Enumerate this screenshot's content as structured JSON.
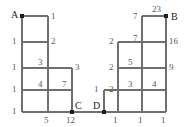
{
  "figure": {
    "type": "grid-diagram",
    "colors": {
      "line": "#6f6f71",
      "vertex": "#1d1d1b",
      "label": "#58585a",
      "point_label": "#1d1d1b",
      "background": "#ffffff"
    }
  },
  "left_figure": {
    "name": "left-grid",
    "vertices": [
      {
        "id": "A",
        "label": "A",
        "x": 22,
        "y": 16
      },
      {
        "id": "C",
        "label": "C",
        "x": 72,
        "y": 112
      }
    ],
    "edges": [
      {
        "id": "l-top",
        "orientation": "horizontal",
        "x1": 22,
        "y1": 16,
        "x2": 48,
        "y2": 16
      },
      {
        "id": "l-r2",
        "orientation": "horizontal",
        "x1": 22,
        "y1": 42,
        "x2": 48,
        "y2": 42
      },
      {
        "id": "l-r3",
        "orientation": "horizontal",
        "x1": 22,
        "y1": 68,
        "x2": 72,
        "y2": 68
      },
      {
        "id": "l-r4",
        "orientation": "horizontal",
        "x1": 22,
        "y1": 90,
        "x2": 72,
        "y2": 90
      },
      {
        "id": "l-base",
        "orientation": "horizontal",
        "x1": 22,
        "y1": 112,
        "x2": 72,
        "y2": 112
      },
      {
        "id": "l-c1",
        "orientation": "vertical",
        "x1": 22,
        "y1": 16,
        "x2": 22,
        "y2": 112
      },
      {
        "id": "l-c2",
        "orientation": "vertical",
        "x1": 48,
        "y1": 16,
        "x2": 48,
        "y2": 112
      },
      {
        "id": "l-c3",
        "orientation": "vertical",
        "x1": 72,
        "y1": 68,
        "x2": 72,
        "y2": 112
      }
    ],
    "labels": [
      {
        "id": "left-A",
        "text": "A",
        "x": 11,
        "y": 10,
        "kind": "point"
      },
      {
        "id": "left-C",
        "text": "C",
        "x": 75,
        "y": 101,
        "kind": "point"
      },
      {
        "id": "left-top-1",
        "text": "1",
        "x": 51,
        "y": 12,
        "kind": "weight"
      },
      {
        "id": "left-row2-left-1",
        "text": "1",
        "x": 12,
        "y": 37,
        "kind": "weight"
      },
      {
        "id": "left-row2-right-2",
        "text": "2",
        "x": 51,
        "y": 37,
        "kind": "weight"
      },
      {
        "id": "left-row3-left-1",
        "text": "1",
        "x": 12,
        "y": 63,
        "kind": "weight"
      },
      {
        "id": "left-row3-mid-3",
        "text": "3",
        "x": 38,
        "y": 58,
        "kind": "weight"
      },
      {
        "id": "left-row3-right-3",
        "text": "3",
        "x": 75,
        "y": 63,
        "kind": "weight"
      },
      {
        "id": "left-row4-left-1",
        "text": "1",
        "x": 12,
        "y": 85,
        "kind": "weight"
      },
      {
        "id": "left-row4-mid-4",
        "text": "4",
        "x": 38,
        "y": 80,
        "kind": "weight"
      },
      {
        "id": "left-row4-right-7",
        "text": "7",
        "x": 62,
        "y": 80,
        "kind": "weight"
      },
      {
        "id": "left-row5-left-1",
        "text": "1",
        "x": 12,
        "y": 107,
        "kind": "weight"
      },
      {
        "id": "left-bottom-5",
        "text": "5",
        "x": 44,
        "y": 116,
        "kind": "weight"
      },
      {
        "id": "left-bottom-12",
        "text": "12",
        "x": 66,
        "y": 116,
        "kind": "weight"
      }
    ]
  },
  "right_figure": {
    "name": "right-grid",
    "vertices": [
      {
        "id": "D",
        "label": "D",
        "x": 104,
        "y": 112
      },
      {
        "id": "B",
        "label": "B",
        "x": 166,
        "y": 16
      }
    ],
    "edges": [
      {
        "id": "r-top",
        "orientation": "horizontal",
        "x1": 142,
        "y1": 16,
        "x2": 166,
        "y2": 16
      },
      {
        "id": "r-r2",
        "orientation": "horizontal",
        "x1": 118,
        "y1": 42,
        "x2": 166,
        "y2": 42
      },
      {
        "id": "r-r3",
        "orientation": "horizontal",
        "x1": 118,
        "y1": 68,
        "x2": 166,
        "y2": 68
      },
      {
        "id": "r-r4",
        "orientation": "horizontal",
        "x1": 104,
        "y1": 90,
        "x2": 166,
        "y2": 90
      },
      {
        "id": "r-base",
        "orientation": "horizontal",
        "x1": 104,
        "y1": 112,
        "x2": 166,
        "y2": 112
      },
      {
        "id": "r-c1",
        "orientation": "vertical",
        "x1": 104,
        "y1": 90,
        "x2": 104,
        "y2": 112
      },
      {
        "id": "r-c2",
        "orientation": "vertical",
        "x1": 118,
        "y1": 42,
        "x2": 118,
        "y2": 112
      },
      {
        "id": "r-c3",
        "orientation": "vertical",
        "x1": 142,
        "y1": 16,
        "x2": 142,
        "y2": 112
      },
      {
        "id": "r-c4",
        "orientation": "vertical",
        "x1": 166,
        "y1": 16,
        "x2": 166,
        "y2": 112
      }
    ],
    "labels": [
      {
        "id": "right-B",
        "text": "B",
        "x": 171,
        "y": 12,
        "kind": "point"
      },
      {
        "id": "right-D",
        "text": "D",
        "x": 93,
        "y": 101,
        "kind": "point"
      },
      {
        "id": "right-top-7",
        "text": "7",
        "x": 133,
        "y": 12,
        "kind": "weight"
      },
      {
        "id": "right-top-23",
        "text": "23",
        "x": 152,
        "y": 5,
        "kind": "weight"
      },
      {
        "id": "right-r2-7",
        "text": "7",
        "x": 133,
        "y": 34,
        "kind": "weight"
      },
      {
        "id": "right-r2-2",
        "text": "2",
        "x": 109,
        "y": 37,
        "kind": "weight"
      },
      {
        "id": "right-r2-16",
        "text": "16",
        "x": 169,
        "y": 37,
        "kind": "weight"
      },
      {
        "id": "right-r3-5",
        "text": "5",
        "x": 128,
        "y": 58,
        "kind": "weight"
      },
      {
        "id": "right-r3-2",
        "text": "2",
        "x": 109,
        "y": 63,
        "kind": "weight"
      },
      {
        "id": "right-r3-9",
        "text": "9",
        "x": 169,
        "y": 63,
        "kind": "weight"
      },
      {
        "id": "right-r4-2",
        "text": "2",
        "x": 109,
        "y": 85,
        "kind": "weight"
      },
      {
        "id": "right-r4-3",
        "text": "3",
        "x": 128,
        "y": 80,
        "kind": "weight"
      },
      {
        "id": "right-r4-4",
        "text": "4",
        "x": 152,
        "y": 80,
        "kind": "weight"
      },
      {
        "id": "right-left-1",
        "text": "1",
        "x": 94,
        "y": 85,
        "kind": "weight"
      },
      {
        "id": "right-bottom-1a",
        "text": "1",
        "x": 113,
        "y": 116,
        "kind": "weight"
      },
      {
        "id": "right-bottom-1b",
        "text": "1",
        "x": 138,
        "y": 116,
        "kind": "weight"
      },
      {
        "id": "right-bottom-1c",
        "text": "1",
        "x": 161,
        "y": 116,
        "kind": "weight"
      }
    ]
  },
  "connector": {
    "name": "baseline-connector",
    "x1": 72,
    "y1": 112,
    "x2": 104,
    "y2": 112
  }
}
